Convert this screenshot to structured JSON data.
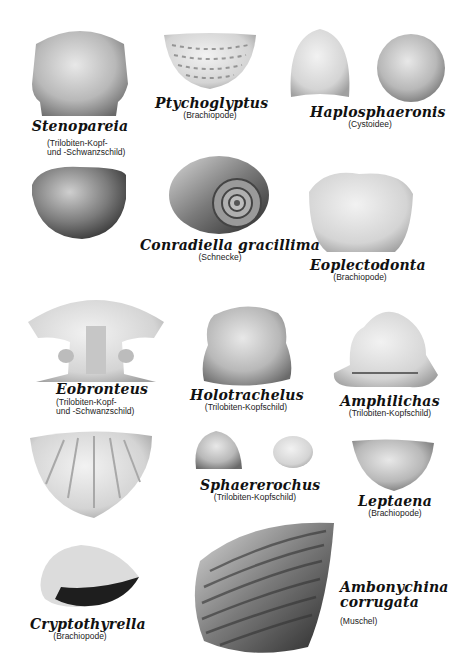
{
  "plate": {
    "background": "#ffffff",
    "fossils": [
      {
        "name": "Stenopareia",
        "desc_lines": [
          "(Trilobiten-Kopf-",
          "und -Schwanzschild)"
        ]
      },
      {
        "name": "Ptychoglyptus",
        "desc_lines": [
          "(Brachiopode)"
        ]
      },
      {
        "name": "Haplosphaeronis",
        "desc_lines": [
          "(Cystoidee)"
        ]
      },
      {
        "name": "Conradiella gracillima",
        "desc_lines": [
          "(Schnecke)"
        ]
      },
      {
        "name": "Eoplectodonta",
        "desc_lines": [
          "(Brachiopode)"
        ]
      },
      {
        "name": "Eobronteus",
        "desc_lines": [
          "(Trilobiten-Kopf-",
          "und -Schwanzschild)"
        ]
      },
      {
        "name": "Holotrachelus",
        "desc_lines": [
          "(Trilobiten-Kopfschild)"
        ]
      },
      {
        "name": "Amphilichas",
        "desc_lines": [
          "(Trilobiten-Kopfschild)"
        ]
      },
      {
        "name": "Sphaererochus",
        "desc_lines": [
          "(Trilobiten-Kopfschild)"
        ]
      },
      {
        "name": "Leptaena",
        "desc_lines": [
          "(Brachiopode)"
        ]
      },
      {
        "name": "Cryptothyrella",
        "desc_lines": [
          "(Brachiopode)"
        ]
      },
      {
        "name": "Ambonychina corrugata",
        "name_lines": [
          "Ambonychina",
          "corrugata"
        ],
        "desc_lines": [
          "(Muschel)"
        ]
      }
    ]
  }
}
